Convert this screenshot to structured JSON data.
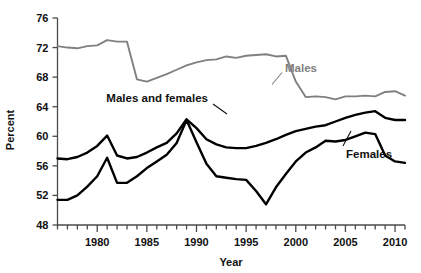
{
  "chart_data": {
    "type": "line",
    "title": "",
    "subtitle": "",
    "xlabel": "Year",
    "ylabel": "Percent",
    "xlim": [
      1976,
      2011
    ],
    "ylim": [
      48,
      76
    ],
    "ytick_labels": [
      "48",
      "52",
      "56",
      "60",
      "64",
      "68",
      "72",
      "76"
    ],
    "yticks": [
      48,
      52,
      56,
      60,
      64,
      68,
      72,
      76
    ],
    "xtick_labels": [
      "1980",
      "1985",
      "1990",
      "1995",
      "2000",
      "2005",
      "2010"
    ],
    "xticks": [
      1980,
      1985,
      1990,
      1995,
      2000,
      2005,
      2010
    ],
    "minor_xticks_every": 1,
    "grid": false,
    "legend_position": "inline-annotations",
    "x": [
      1976,
      1977,
      1978,
      1979,
      1980,
      1981,
      1982,
      1983,
      1984,
      1985,
      1986,
      1987,
      1988,
      1989,
      1990,
      1991,
      1992,
      1993,
      1994,
      1995,
      1996,
      1997,
      1998,
      1999,
      2000,
      2001,
      2002,
      2003,
      2004,
      2005,
      2006,
      2007,
      2008,
      2009,
      2010,
      2011
    ],
    "series": [
      {
        "name": "Males",
        "color": "#808080",
        "label": "Males",
        "values": [
          72.2,
          72.0,
          71.9,
          72.2,
          72.3,
          73.0,
          72.8,
          72.8,
          67.7,
          67.4,
          67.9,
          68.4,
          69.0,
          69.6,
          70.0,
          70.3,
          70.4,
          70.8,
          70.6,
          70.9,
          71.0,
          71.1,
          70.8,
          70.9,
          67.4,
          65.3,
          65.4,
          65.3,
          65.0,
          65.4,
          65.4,
          65.5,
          65.4,
          66.0,
          66.1,
          65.5
        ]
      },
      {
        "name": "Males and females",
        "color": "#000000",
        "label": "Males and females",
        "values": [
          57.0,
          56.9,
          57.2,
          57.8,
          58.7,
          60.1,
          57.4,
          57.0,
          57.2,
          57.8,
          58.5,
          59.1,
          60.4,
          62.3,
          61.1,
          59.6,
          58.9,
          58.5,
          58.4,
          58.4,
          58.7,
          59.1,
          59.6,
          60.2,
          60.7,
          61.0,
          61.3,
          61.5,
          62.0,
          62.5,
          62.9,
          63.2,
          63.4,
          62.5,
          62.2,
          62.2
        ]
      },
      {
        "name": "Females",
        "color": "#000000",
        "label": "Females",
        "values": [
          51.4,
          51.4,
          52.0,
          53.2,
          54.6,
          57.1,
          53.7,
          53.7,
          54.6,
          55.7,
          56.6,
          57.5,
          59.1,
          62.2,
          59.2,
          56.3,
          54.6,
          54.4,
          54.2,
          54.1,
          52.6,
          50.8,
          53.1,
          54.9,
          56.6,
          57.8,
          58.5,
          59.4,
          59.3,
          59.5,
          60.0,
          60.5,
          60.3,
          57.4,
          56.6,
          56.4
        ]
      }
    ],
    "annotations": [
      {
        "name": "males-annotation",
        "text": "Males",
        "x": 1995.0,
        "y": 68.6
      },
      {
        "name": "males-and-females-annotation",
        "text": "Males and females",
        "x": 1982.4,
        "y": 64.0
      },
      {
        "name": "females-annotation",
        "text": "Females",
        "x": 2003.6,
        "y": 55.6
      }
    ]
  }
}
